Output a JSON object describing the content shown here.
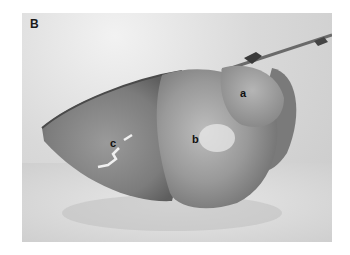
{
  "figure": {
    "panel_label": "B",
    "labels": [
      {
        "id": "a",
        "text": "a"
      },
      {
        "id": "b",
        "text": "b"
      },
      {
        "id": "c",
        "text": "c"
      }
    ]
  }
}
